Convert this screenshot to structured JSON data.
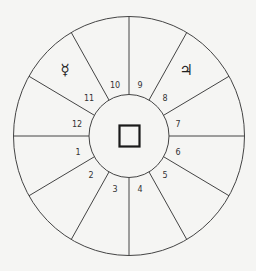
{
  "diagram": {
    "type": "astrological-house-chart",
    "center": {
      "x": 129,
      "y": 136
    },
    "outer_radius": {
      "rx": 115.5,
      "ry": 119.5
    },
    "inner_radius": {
      "rx": 40,
      "ry": 41.5
    },
    "line_color": "#444444",
    "background": "#f5f5f3",
    "center_symbol": "square",
    "houses": [
      {
        "number": "1",
        "x": 78,
        "y": 155
      },
      {
        "number": "2",
        "x": 91,
        "y": 178
      },
      {
        "number": "3",
        "x": 115,
        "y": 192
      },
      {
        "number": "4",
        "x": 140,
        "y": 192
      },
      {
        "number": "5",
        "x": 165,
        "y": 178
      },
      {
        "number": "6",
        "x": 178,
        "y": 155
      },
      {
        "number": "7",
        "x": 178,
        "y": 127
      },
      {
        "number": "8",
        "x": 165,
        "y": 101
      },
      {
        "number": "9",
        "x": 140,
        "y": 88
      },
      {
        "number": "10",
        "x": 115,
        "y": 88
      },
      {
        "number": "11",
        "x": 89,
        "y": 101
      },
      {
        "number": "12",
        "x": 77,
        "y": 127
      }
    ],
    "planets": [
      {
        "name": "Mercury",
        "glyph": "☿",
        "house": "11",
        "x": 65,
        "y": 75
      },
      {
        "name": "Jupiter",
        "glyph": "♃",
        "house": "8",
        "x": 186,
        "y": 75
      }
    ]
  }
}
